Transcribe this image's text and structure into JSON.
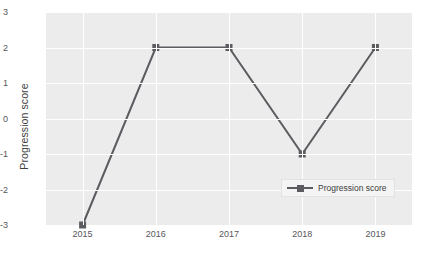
{
  "chart_data": {
    "type": "line",
    "title": "",
    "xlabel": "",
    "ylabel": "Progression score",
    "categories": [
      "2015",
      "2016",
      "2017",
      "2018",
      "2019"
    ],
    "series": [
      {
        "name": "Progression score",
        "values": [
          -3,
          2,
          2,
          -1,
          2
        ]
      }
    ],
    "ylim": [
      -3,
      3
    ],
    "yticks": [
      "3",
      "2",
      "1",
      "0",
      "-1",
      "-2",
      "-3"
    ],
    "ytick_values": [
      3,
      2,
      1,
      0,
      -1,
      -2,
      -3
    ],
    "grid": true,
    "legend_position": "inside-lower-right",
    "colors": {
      "line": "#5c5c60",
      "marker": "#5c5c60",
      "plot_background": "#ececed",
      "gridline": "#ffffff",
      "tick_label": "#56565a",
      "axis_label": "#3f3f3f"
    },
    "marker": "square",
    "line_width": 2
  },
  "legend": {
    "entries": [
      {
        "label": "Progression score"
      }
    ]
  },
  "caption": {
    "text": ""
  }
}
